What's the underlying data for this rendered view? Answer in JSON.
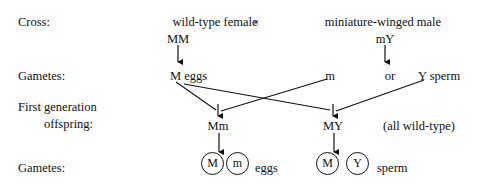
{
  "diagram": {
    "title_rows": {
      "cross_label": "Cross:",
      "gametes_label_1": "Gametes:",
      "offspring_label_line1": "First generation",
      "offspring_label_line2": "offspring:",
      "gametes_label_2": "Gametes:"
    },
    "parents": {
      "female_phenotype": "wild-type female",
      "female_genotype": "MM",
      "cross_symbol": "×",
      "male_phenotype": "miniature-winged male",
      "male_genotype": "mY"
    },
    "parent_gametes": {
      "egg": "M eggs",
      "sperm_allele_1": "m",
      "conjunction": "or",
      "sperm_allele_2": "Y sperm"
    },
    "offspring": {
      "genotype_1": "Mm",
      "genotype_2": "MY",
      "note": "(all wild-type)"
    },
    "offspring_gametes": {
      "egg_allele_1": "M",
      "egg_allele_2": "m",
      "egg_label": "eggs",
      "sperm_allele_1": "M",
      "sperm_allele_2": "Y",
      "sperm_label": "sperm"
    },
    "colors": {
      "ink": "#111111",
      "background": "#ffffff"
    }
  }
}
